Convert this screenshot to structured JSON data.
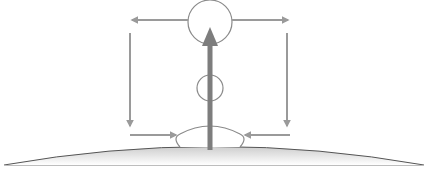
{
  "diagram": {
    "type": "convection-circulation",
    "labels": [],
    "colors": {
      "background": "#ffffff",
      "arrow": "#9a9a9a",
      "main_arrow": "#7d7d7d",
      "circle_stroke": "#8a8a8a",
      "ground_stroke": "#555555",
      "ground_fill_top": "#cfcfcf",
      "ground_fill_bottom": "#ffffff"
    },
    "elements": {
      "top_circle": {
        "cx": 210,
        "cy": 22,
        "r": 22
      },
      "middle_circle": {
        "cx": 210,
        "cy": 88,
        "r": 13
      },
      "main_updraft_arrow": {
        "x": 210,
        "y_from": 150,
        "y_to": 27,
        "direction": "up"
      },
      "top_left_arrow": {
        "y": 20,
        "x_from": 188,
        "x_to": 130,
        "direction": "left"
      },
      "top_right_arrow": {
        "y": 20,
        "x_from": 232,
        "x_to": 290,
        "direction": "right"
      },
      "left_descending_arrow": {
        "x": 130,
        "y_from": 33,
        "y_to": 128,
        "direction": "down"
      },
      "right_descending_arrow": {
        "x": 287,
        "y_from": 33,
        "y_to": 128,
        "direction": "down"
      },
      "bottom_left_inflow_arrow": {
        "y": 135,
        "x_from": 130,
        "x_to": 178,
        "direction": "right"
      },
      "bottom_right_inflow_arrow": {
        "y": 135,
        "x_from": 290,
        "x_to": 243,
        "direction": "left"
      },
      "surface_dome": {
        "x_start": 177,
        "x_end": 244,
        "top_y": 128,
        "base_y": 147
      },
      "ground_surface": {
        "x_start": 4,
        "x_end": 424,
        "edge_y": 165,
        "peak_y": 146
      }
    }
  }
}
